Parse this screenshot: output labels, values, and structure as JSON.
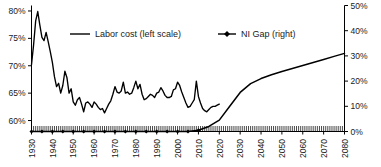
{
  "chart_data": {
    "type": "line",
    "title": "",
    "xlabel": "",
    "ylabel": "",
    "grid": false,
    "legend_position": "top-center",
    "xlim": [
      1930,
      2080
    ],
    "x_ticks": [
      "1930",
      "1940",
      "1950",
      "1960",
      "1970",
      "1980",
      "1990",
      "2000",
      "2010",
      "2020",
      "2030",
      "2040",
      "2050",
      "2060",
      "2070",
      "2080"
    ],
    "x_minor_tick_interval": 1,
    "left_axis": {
      "label": "Labor cost (left scale)",
      "ylim": [
        58,
        81
      ],
      "ticks": [
        "60%",
        "65%",
        "70%",
        "75%",
        "80%"
      ],
      "tick_values": [
        60,
        65,
        70,
        75,
        80
      ]
    },
    "right_axis": {
      "label": "NI Gap (right)",
      "ylim": [
        0,
        50
      ],
      "ticks": [
        "0%",
        "10%",
        "20%",
        "30%",
        "40%",
        "50%"
      ],
      "tick_values": [
        0,
        10,
        20,
        30,
        40,
        50
      ]
    },
    "series": [
      {
        "name": "Labor cost (left scale)",
        "axis": "left",
        "color": "#000000",
        "marker": "none",
        "x": [
          1930,
          1931,
          1932,
          1933,
          1934,
          1935,
          1936,
          1937,
          1938,
          1939,
          1940,
          1941,
          1942,
          1943,
          1944,
          1945,
          1946,
          1947,
          1948,
          1949,
          1950,
          1951,
          1952,
          1953,
          1954,
          1955,
          1956,
          1957,
          1958,
          1959,
          1960,
          1961,
          1962,
          1963,
          1964,
          1965,
          1966,
          1967,
          1968,
          1969,
          1970,
          1971,
          1972,
          1973,
          1974,
          1975,
          1976,
          1977,
          1978,
          1979,
          1980,
          1981,
          1982,
          1983,
          1984,
          1985,
          1986,
          1987,
          1988,
          1989,
          1990,
          1991,
          1992,
          1993,
          1994,
          1995,
          1996,
          1997,
          1998,
          1999,
          2000,
          2001,
          2002,
          2003,
          2004,
          2005,
          2006,
          2007,
          2008,
          2009,
          2010,
          2011,
          2012,
          2013,
          2014,
          2015,
          2016,
          2017,
          2018,
          2019,
          2020
        ],
        "values": [
          70.2,
          73.8,
          78.2,
          79.9,
          77.4,
          75.2,
          74.6,
          76.1,
          74.4,
          72.6,
          70.6,
          68.0,
          66.2,
          66.8,
          65.0,
          66.4,
          69.0,
          67.8,
          65.0,
          65.8,
          63.4,
          62.8,
          63.8,
          64.2,
          63.0,
          61.6,
          63.2,
          63.4,
          63.0,
          62.4,
          63.4,
          63.0,
          62.4,
          62.0,
          62.2,
          61.4,
          62.2,
          63.0,
          63.6,
          64.8,
          66.2,
          65.2,
          65.0,
          65.4,
          67.0,
          65.0,
          65.2,
          64.8,
          65.0,
          66.0,
          67.2,
          65.8,
          66.6,
          64.8,
          63.8,
          64.0,
          64.4,
          64.8,
          64.6,
          64.2,
          65.0,
          65.2,
          66.0,
          65.4,
          64.6,
          64.2,
          64.2,
          64.4,
          65.6,
          65.8,
          67.0,
          66.4,
          65.2,
          64.2,
          63.2,
          62.4,
          62.6,
          63.2,
          63.8,
          67.2,
          64.4,
          63.2,
          62.2,
          61.8,
          61.6,
          62.0,
          62.4,
          62.6,
          62.6,
          62.8,
          63.0
        ]
      },
      {
        "name": "NI Gap (right)",
        "axis": "right",
        "color": "#000000",
        "marker": "diamond",
        "x": [
          1930,
          1935,
          1940,
          1945,
          1950,
          1955,
          1960,
          1965,
          1970,
          1975,
          1980,
          1985,
          1990,
          1995,
          2000,
          2005,
          2010,
          2015,
          2020,
          2025,
          2030,
          2035,
          2040,
          2045,
          2050,
          2055,
          2060,
          2065,
          2070,
          2075,
          2080
        ],
        "values": [
          0,
          0,
          0,
          0,
          0,
          0,
          0,
          0,
          0,
          0,
          0,
          0,
          0,
          0,
          0,
          0,
          0.5,
          2.0,
          4.5,
          10.0,
          15.5,
          19.0,
          21.0,
          22.5,
          23.8,
          25.0,
          26.2,
          27.4,
          28.6,
          29.8,
          31.0
        ]
      }
    ],
    "note": "Labor cost plotted on left scale (60-80%), NI Gap projection on right scale (0-50%)"
  }
}
